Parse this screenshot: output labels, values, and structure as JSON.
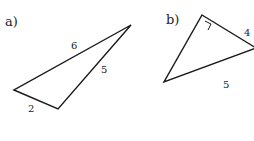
{
  "figures": [
    {
      "part_label": "a)",
      "sides": {
        "top": "6",
        "right": "5",
        "bottom": "2"
      },
      "vertices": [
        [
          14,
          90
        ],
        [
          58,
          109
        ],
        [
          131,
          25
        ]
      ]
    },
    {
      "part_label": "b)",
      "sides": {
        "top_right": "4",
        "bottom": "5"
      },
      "right_angle": true,
      "vertices": [
        [
          202,
          15
        ],
        [
          254,
          48
        ],
        [
          164,
          82
        ]
      ]
    }
  ],
  "colors": {
    "stroke": "#1a1a1a",
    "background": "#ffffff"
  }
}
